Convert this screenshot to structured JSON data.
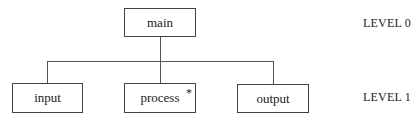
{
  "diagram": {
    "type": "hierarchy-chart",
    "root": {
      "label": "main"
    },
    "children": [
      {
        "label": "input"
      },
      {
        "label": "process",
        "marker": "*"
      },
      {
        "label": "output"
      }
    ],
    "levels": [
      "LEVEL 0",
      "LEVEL 1"
    ]
  }
}
